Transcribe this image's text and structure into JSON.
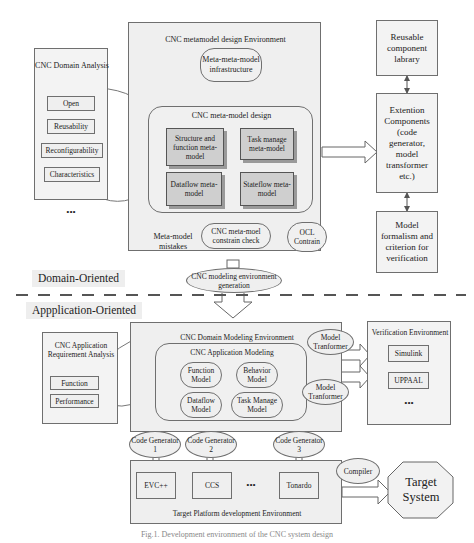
{
  "meta_env": {
    "title": "CNC metamodel design Environment",
    "infrastructure": "Meta-meta-model infrastructure",
    "design": {
      "title": "CNC meta-model design",
      "items": [
        "Structure and function meta-model",
        "Task manage meta-model",
        "Dataflow meta-model",
        "Stateflow meta-model"
      ]
    },
    "constraint_check": "CNC meta-moel constrain check",
    "ocl": "OCL Contrain",
    "mistakes": "Meta-model mistakes"
  },
  "domain_analysis": {
    "title": "CNC Domain Analysis",
    "items": [
      "Open",
      "Reusability",
      "Reconfigurability",
      "Characteristics"
    ],
    "more": "•••"
  },
  "right_top": {
    "library": "Reusable component labrary",
    "extension": "Extention Components (code generator, model transformer etc.)",
    "formalism": "Model formalism and criterion for verification"
  },
  "env_generation": "CNC modeling environment generation",
  "sections": {
    "domain": "Domain-Oriented",
    "application": "Appplication-Oriented"
  },
  "app_analysis": {
    "title": "CNC Application Requirement Analysis",
    "items": [
      "Function",
      "Performance"
    ]
  },
  "domain_modeling_env": {
    "title": "CNC Domain  Modeling Environment",
    "app_modeling": {
      "title": "CNC Application Modeling",
      "items": [
        "Function Model",
        "Behavior Model",
        "Dataflow Model",
        "Task Manage Model"
      ]
    }
  },
  "transformers": [
    "Model Tranformer",
    "Model Tranformer"
  ],
  "verification": {
    "title": "Verification Environment",
    "items": [
      "Simulink",
      "UPPAAL"
    ],
    "more": "•••"
  },
  "code_generators": [
    "Code Generator 1",
    "Code Generator 2",
    "Code Generator 3"
  ],
  "target_platform": {
    "title": "Target Platform  development Environment",
    "items": [
      "EVC++",
      "CCS",
      "Tonardo"
    ],
    "more": "•••"
  },
  "compiler": "Compiler",
  "target_system": "Target System",
  "caption": "Fig.1. Development environment of the CNC system design"
}
